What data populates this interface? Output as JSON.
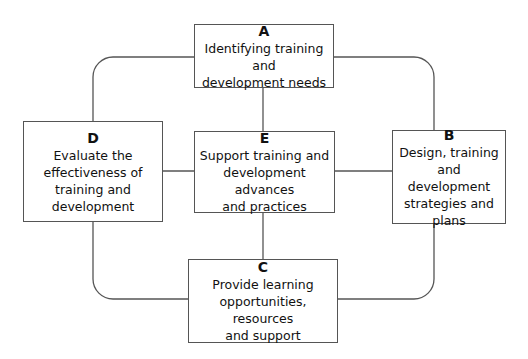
{
  "diagram": {
    "type": "cycle-with-hub",
    "line_color": "#555555",
    "nodes": [
      {
        "id": "A",
        "letter": "A",
        "text": "Identifying training and\ndevelopment needs"
      },
      {
        "id": "B",
        "letter": "B",
        "text": "Design, training and\ndevelopment\nstrategies and plans"
      },
      {
        "id": "C",
        "letter": "C",
        "text": "Provide learning\nopportunities, resources\nand support"
      },
      {
        "id": "D",
        "letter": "D",
        "text": "Evaluate the\neffectiveness of\ntraining and\ndevelopment"
      },
      {
        "id": "E",
        "letter": "E",
        "text": "Support training and\ndevelopment advances\nand practices"
      }
    ],
    "edges": [
      [
        "A",
        "B"
      ],
      [
        "B",
        "C"
      ],
      [
        "C",
        "D"
      ],
      [
        "D",
        "A"
      ],
      [
        "E",
        "A"
      ],
      [
        "E",
        "B"
      ],
      [
        "E",
        "C"
      ],
      [
        "E",
        "D"
      ]
    ]
  }
}
